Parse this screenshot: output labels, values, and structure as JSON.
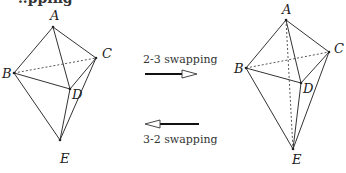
{
  "header": {
    "cut_text": "..pping"
  },
  "left_figure": {
    "vertices": {
      "A": {
        "label": "A",
        "x": 53,
        "y": 27
      },
      "B": {
        "label": "B",
        "x": 14,
        "y": 73
      },
      "C": {
        "label": "C",
        "x": 96,
        "y": 58
      },
      "D": {
        "label": "D",
        "x": 70,
        "y": 89
      },
      "E": {
        "label": "E",
        "x": 60,
        "y": 140
      }
    },
    "solid_edges": [
      [
        "A",
        "B"
      ],
      [
        "A",
        "C"
      ],
      [
        "A",
        "D"
      ],
      [
        "B",
        "D"
      ],
      [
        "C",
        "D"
      ],
      [
        "B",
        "E"
      ],
      [
        "C",
        "E"
      ],
      [
        "D",
        "E"
      ]
    ],
    "dashed_edges": [
      [
        "B",
        "C"
      ]
    ]
  },
  "right_figure": {
    "vertices": {
      "A": {
        "label": "A",
        "x": 286,
        "y": 20
      },
      "B": {
        "label": "B",
        "x": 246,
        "y": 68
      },
      "C": {
        "label": "C",
        "x": 329,
        "y": 52
      },
      "D": {
        "label": "D",
        "x": 301,
        "y": 83
      },
      "E": {
        "label": "E",
        "x": 293,
        "y": 149
      }
    },
    "solid_edges": [
      [
        "A",
        "B"
      ],
      [
        "A",
        "C"
      ],
      [
        "A",
        "D"
      ],
      [
        "B",
        "D"
      ],
      [
        "C",
        "D"
      ],
      [
        "B",
        "E"
      ],
      [
        "C",
        "E"
      ],
      [
        "D",
        "E"
      ]
    ],
    "dashed_edges": [
      [
        "B",
        "C"
      ],
      [
        "A",
        "E"
      ]
    ]
  },
  "arrows": {
    "forward": {
      "label": "2-3 swapping",
      "direction": "right"
    },
    "backward": {
      "label": "3-2 swapping",
      "direction": "left"
    }
  }
}
